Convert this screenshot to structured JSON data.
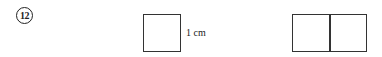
{
  "problem": {
    "number": "12"
  },
  "figure": {
    "unit_square_label": "1 cm",
    "shapes": [
      {
        "name": "unit-square",
        "cells": 1
      },
      {
        "name": "two-square-rectangle",
        "cells": 2
      }
    ]
  }
}
